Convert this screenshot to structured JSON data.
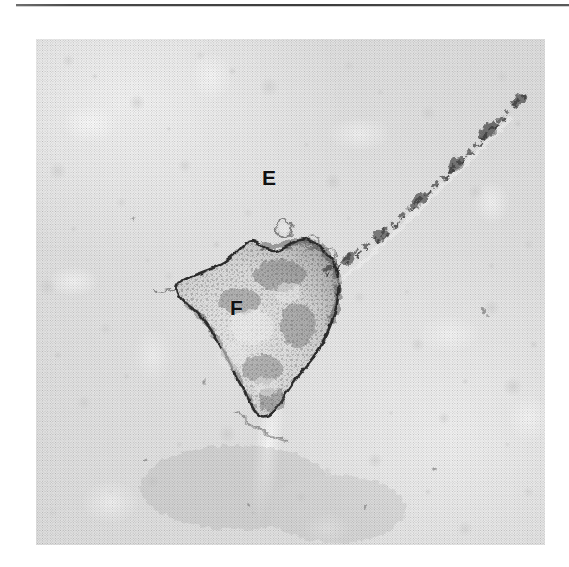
{
  "figure": {
    "kind": "electron-micrograph",
    "labels": [
      {
        "id": "E",
        "text": "E",
        "meaning": "label-e",
        "x": 262,
        "y": 167
      },
      {
        "id": "F",
        "text": "F",
        "meaning": "label-f",
        "x": 230,
        "y": 297
      }
    ],
    "rule": {
      "present": true,
      "color": "#3c3c3c"
    },
    "plate": {
      "x": 36,
      "y": 39,
      "width": 509,
      "height": 506,
      "background_color": "#e6e6e6",
      "ink_color": "#2b2b2b",
      "highlight_color": "#ffffff"
    },
    "structures": [
      {
        "name": "dark-cell-body",
        "label": "F"
      },
      {
        "name": "membrane-track",
        "label": "E"
      },
      {
        "name": "vesicle-ring",
        "label": ""
      }
    ]
  }
}
